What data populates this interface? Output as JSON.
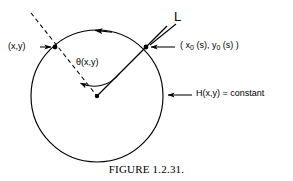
{
  "figure": {
    "caption": "FIGURE 1.2.31.",
    "labels": {
      "line_L": "L",
      "point_xy": "(x,y)",
      "point_param_prefix": "( x",
      "point_param_sub1": "0",
      "point_param_mid": " (s), y",
      "point_param_sub2": "0",
      "point_param_suffix": " (s) )",
      "angle_theta": "θ(x,y)",
      "level_set": "H(x,y) = constant"
    },
    "geometry": {
      "circle_center_x": 97,
      "circle_center_y": 96,
      "circle_radius": 66,
      "point_xy_x": 55,
      "point_xy_y": 47,
      "point_param_x": 146,
      "point_param_y": 47,
      "orientation": "counterclockwise"
    },
    "colors": {
      "ink": "#000000",
      "background": "#ffffff"
    }
  }
}
